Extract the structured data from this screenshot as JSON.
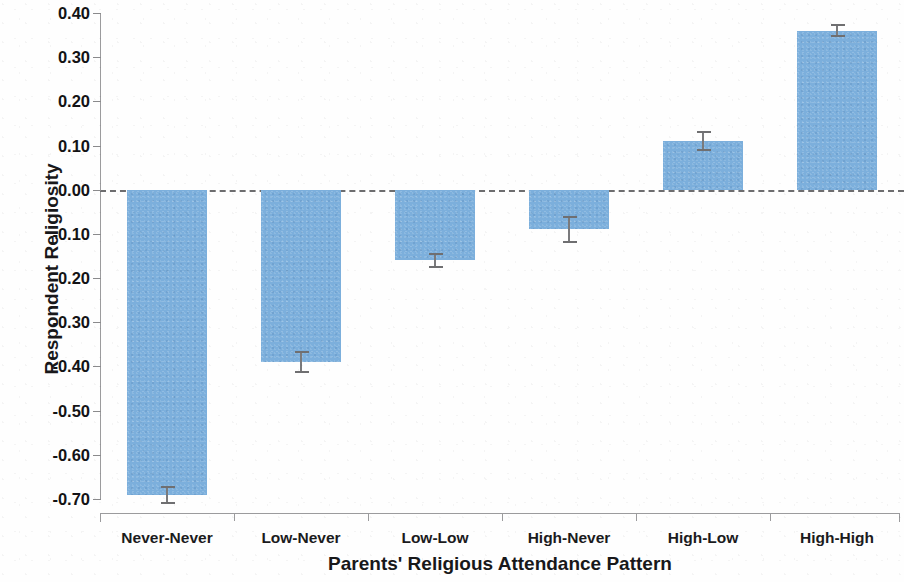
{
  "chart_data": {
    "type": "bar",
    "title": "",
    "xlabel": "Parents' Religious Attendance Pattern",
    "ylabel": "Respondent Religiosity",
    "categories": [
      "Never-Never",
      "Low-Never",
      "Low-Low",
      "High-Never",
      "High-Low",
      "High-High"
    ],
    "values": [
      -0.69,
      -0.39,
      -0.16,
      -0.09,
      0.11,
      0.36
    ],
    "errors": [
      0.018,
      0.022,
      0.015,
      0.028,
      0.02,
      0.012
    ],
    "ylim": [
      -0.7,
      0.4
    ],
    "ytick_values": [
      0.4,
      0.3,
      0.2,
      0.1,
      0.0,
      -0.1,
      -0.2,
      -0.3,
      -0.4,
      -0.5,
      -0.6,
      -0.7
    ],
    "ytick_labels": [
      "0.40",
      "0.30",
      "0.20",
      "0.10",
      "0.00",
      "-0.10",
      "-0.20",
      "-0.30",
      "-0.40",
      "-0.50",
      "-0.60",
      "-0.70"
    ],
    "grid": false,
    "legend": null,
    "zero_reference_line": true,
    "bar_color": "#7CAFDC",
    "error_bar_color": "#7A7A7C",
    "axis_color": "#9B9B9D"
  }
}
